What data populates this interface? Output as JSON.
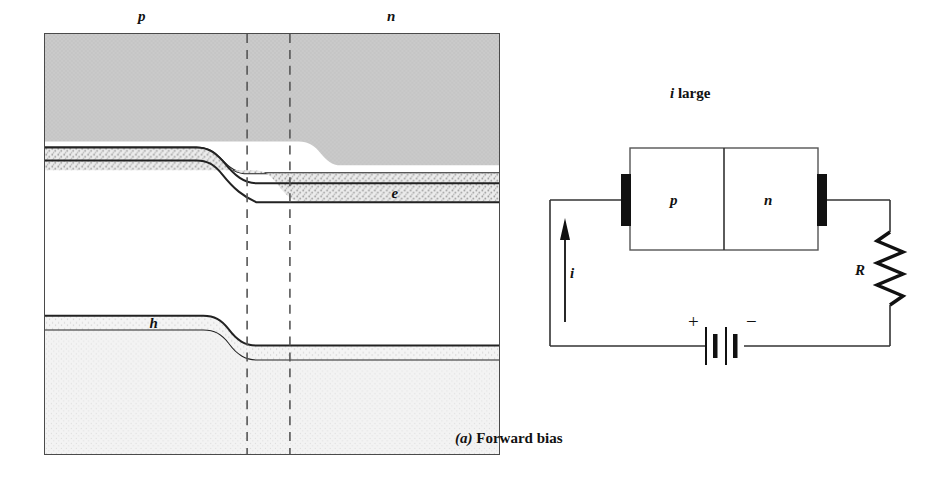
{
  "figure": {
    "caption_index": "(a)",
    "caption_text": "Forward bias",
    "width": 942,
    "height": 486
  },
  "band_diagram": {
    "region_labels": {
      "p": "p",
      "n": "n"
    },
    "carrier_labels": {
      "electron": "e",
      "hole": "h"
    },
    "colors": {
      "conduction_fill": "#c9c9c9",
      "electron_fill": "#e2e2e2",
      "hole_fill": "#f0f0f0",
      "valence_fill": "#f2f2f2",
      "band_line": "#222222",
      "frame_line": "#4a4a4a",
      "dashed_line": "#555555",
      "background": "#ffffff"
    },
    "depletion_edges": {
      "left_x": 203,
      "right_x": 246
    },
    "notes": "p-n junction energy band diagram under forward bias; bands step down from p side to n side across the depletion region"
  },
  "circuit": {
    "title": "i large",
    "title_symbol": "i",
    "title_word": "large",
    "diode": {
      "left_region": "p",
      "right_region": "n"
    },
    "resistor_label": "R",
    "current_label": "i",
    "battery": {
      "positive": "+",
      "negative": "−"
    },
    "colors": {
      "wire": "#333333",
      "electrode": "#111111",
      "resistor": "#111111"
    }
  }
}
